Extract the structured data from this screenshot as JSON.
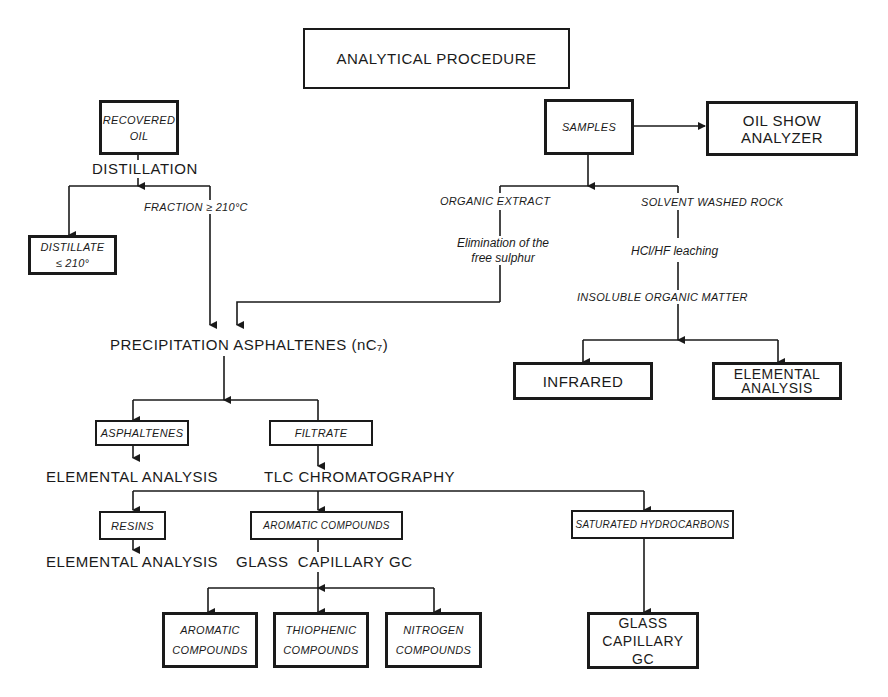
{
  "title": "ANALYTICAL PROCEDURE",
  "nodes": {
    "recovered_oil": "RECOVERED\nOIL",
    "distillation": "DISTILLATION",
    "fraction": "FRACTION ≥ 210°C",
    "distillate": "DISTILLATE\n≤ 210°",
    "samples": "SAMPLES",
    "oil_show_analyzer": "OIL SHOW\nANALYZER",
    "organic_extract": "ORGANIC EXTRACT",
    "solvent_washed_rock": "SOLVENT WASHED ROCK",
    "elimination": "Elimination of the\nfree sulphur",
    "leaching": "HCl/HF  leaching",
    "insoluble": "INSOLUBLE ORGANIC MATTER",
    "infrared": "INFRARED",
    "elemental_analysis_box": "ELEMENTAL\nANALYSIS",
    "precipitation": "PRECIPITATION ASPHALTENES (nC₇)",
    "asphaltenes": "ASPHALTENES",
    "filtrate": "FILTRATE",
    "elemental_analysis_1": "ELEMENTAL ANALYSIS",
    "tlc": "TLC CHROMATOGRAPHY",
    "resins": "RESINS",
    "aromatic_compounds": "AROMATIC COMPOUNDS",
    "saturated_hydrocarbons": "SATURATED HYDROCARBONS",
    "elemental_analysis_2": "ELEMENTAL ANALYSIS",
    "glass_capillary_gc_text": "GLASS  CAPILLARY GC",
    "aromatic_compounds_2": "AROMATIC\nCOMPOUNDS",
    "thiophenic_compounds": "THIOPHENIC\nCOMPOUNDS",
    "nitrogen_compounds": "NITROGEN\nCOMPOUNDS",
    "glass_capillary_gc_box": "GLASS\nCAPILLARY GC"
  }
}
